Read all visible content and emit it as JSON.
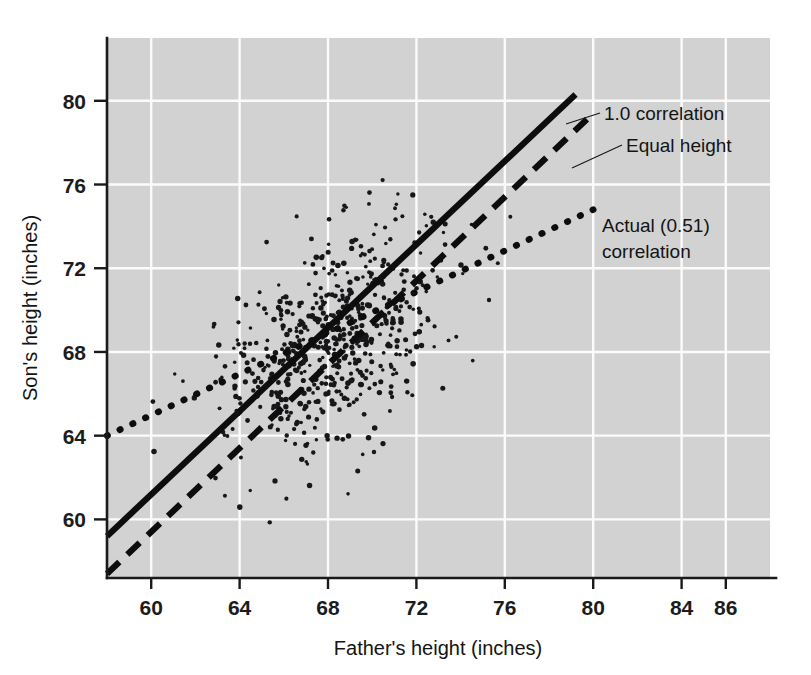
{
  "chart_data": {
    "type": "scatter",
    "title": "",
    "xlabel": "Father's height (inches)",
    "ylabel": "Son's height (inches)",
    "xlim": [
      58.0,
      88.0
    ],
    "ylim": [
      57.2,
      83.0
    ],
    "xticks": [
      60,
      64,
      68,
      72,
      76,
      80,
      84,
      86
    ],
    "xticklabels": [
      "60",
      "64",
      "68",
      "72",
      "76",
      "80",
      "84",
      "86"
    ],
    "yticks": [
      60,
      64,
      68,
      72,
      76,
      80
    ],
    "yticklabels": [
      "60",
      "64",
      "68",
      "72",
      "76",
      "80"
    ],
    "grid": true,
    "grid_color": "#fbfbfb",
    "plot_background": "#d2d2d2",
    "page_background": "#ffffff",
    "point_color": "#17171a",
    "point_count": 620,
    "scatter_center": {
      "x": 68.0,
      "y": 68.6
    },
    "scatter_sd": {
      "x": 2.6,
      "y": 2.8
    },
    "correlation": 0.51,
    "legend_position": "inline-annotations",
    "series": [
      {
        "name": "1.0 correlation",
        "style": "solid",
        "label": "1.0 correlation",
        "points": [
          [
            58.0,
            59.2
          ],
          [
            79.2,
            80.3
          ]
        ],
        "label_xy": [
          80.0,
          80.2
        ]
      },
      {
        "name": "Equal height",
        "style": "dashed",
        "label": "Equal height",
        "points": [
          [
            58.0,
            57.4
          ],
          [
            80.0,
            79.4
          ]
        ],
        "label_xy": [
          80.0,
          77.8
        ]
      },
      {
        "name": "Actual (0.51) correlation",
        "style": "dotted",
        "label_line1": "Actual (0.51)",
        "label_line2": "correlation",
        "points": [
          [
            58.0,
            64.0
          ],
          [
            80.0,
            74.8
          ]
        ],
        "label_xy": [
          80.0,
          74.2
        ]
      }
    ],
    "annotations": [
      {
        "text": "1.0 correlation",
        "target": "solid-line"
      },
      {
        "text": "Equal height",
        "target": "dashed-line"
      },
      {
        "text": "Actual (0.51)",
        "target": "dotted-line"
      },
      {
        "text": "correlation",
        "target": "dotted-line"
      }
    ]
  }
}
